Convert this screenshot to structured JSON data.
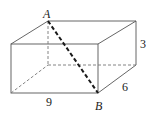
{
  "figure": {
    "type": "rectangular-prism",
    "points": {
      "A": {
        "label": "A"
      },
      "B": {
        "label": "B"
      }
    },
    "dimensions": {
      "length": {
        "label": "9"
      },
      "width": {
        "label": "6"
      },
      "height": {
        "label": "3"
      }
    },
    "colors": {
      "edges": "#555555",
      "hidden_edges": "#777777",
      "diagonal": "#1a1a1a",
      "text": "#222222"
    }
  }
}
